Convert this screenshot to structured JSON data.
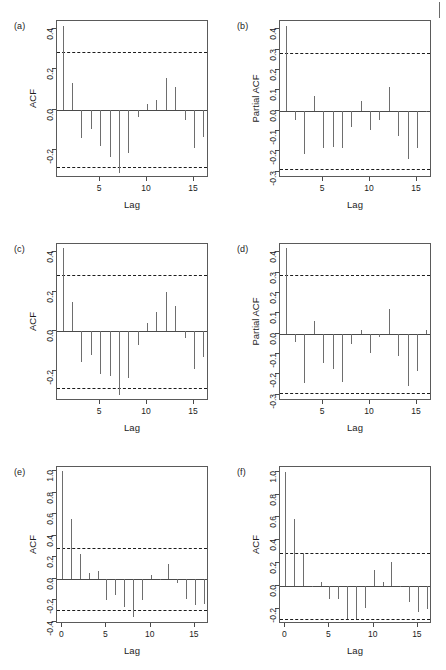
{
  "figure": {
    "width": 446,
    "height": 670,
    "background": "#ffffff",
    "bar_color": "#6e6e6e",
    "axis_color": "#4a4a4a",
    "band_color": "#1c1c1c",
    "corner_mark": "page-edge-tick"
  },
  "common": {
    "xlabel": "Lag",
    "acf_ylabel": "ACF",
    "pacf_ylabel": "Partial ACF"
  },
  "chart_data": [
    {
      "id": "a",
      "tag": "(a)",
      "type": "bar",
      "title": "",
      "xlabel": "Lag",
      "ylabel": "ACF",
      "xticks": [
        5,
        10,
        15
      ],
      "xticklabels": [
        "5",
        "10",
        "15"
      ],
      "yticks": [
        -0.2,
        0.0,
        0.2,
        0.4
      ],
      "yticklabels": [
        "-0.2",
        "0.0",
        "0.2",
        "0.4"
      ],
      "xlim": [
        0.4,
        16.6
      ],
      "ylim": [
        -0.34,
        0.44
      ],
      "conf_level": 0.285,
      "grid": false,
      "legend": "none",
      "x": [
        1,
        2,
        3,
        4,
        5,
        6,
        7,
        8,
        9,
        10,
        11,
        12,
        13,
        14,
        15,
        16
      ],
      "values": [
        0.415,
        0.131,
        -0.139,
        -0.098,
        -0.182,
        -0.237,
        -0.315,
        -0.216,
        -0.039,
        0.028,
        0.05,
        0.156,
        0.11,
        -0.05,
        -0.192,
        -0.135
      ]
    },
    {
      "id": "b",
      "tag": "(b)",
      "type": "bar",
      "title": "",
      "xlabel": "Lag",
      "ylabel": "Partial ACF",
      "xticks": [
        5,
        10,
        15
      ],
      "xticklabels": [
        "5",
        "10",
        "15"
      ],
      "yticks": [
        -0.3,
        -0.2,
        -0.1,
        0.0,
        0.1,
        0.2,
        0.3,
        0.4
      ],
      "yticklabels": [
        "-0.3",
        "-0.2",
        "-0.1",
        "0.0",
        "0.1",
        "0.2",
        "0.3",
        "0.4"
      ],
      "xlim": [
        0.4,
        16.6
      ],
      "ylim": [
        -0.33,
        0.44
      ],
      "conf_level": 0.285,
      "grid": false,
      "legend": "none",
      "x": [
        1,
        2,
        3,
        4,
        5,
        6,
        7,
        8,
        9,
        10,
        11,
        12,
        13,
        14,
        15,
        16
      ],
      "values": [
        0.415,
        -0.048,
        -0.211,
        0.073,
        -0.182,
        -0.178,
        -0.182,
        -0.081,
        0.05,
        -0.094,
        -0.045,
        0.117,
        -0.122,
        -0.237,
        -0.181,
        -0.005
      ]
    },
    {
      "id": "c",
      "tag": "(c)",
      "type": "bar",
      "title": "",
      "xlabel": "Lag",
      "ylabel": "ACF",
      "xticks": [
        5,
        10,
        15
      ],
      "xticklabels": [
        "5",
        "10",
        "15"
      ],
      "yticks": [
        -0.2,
        0.0,
        0.2,
        0.4
      ],
      "yticklabels": [
        "-0.2",
        "0.0",
        "0.2",
        "0.4"
      ],
      "xlim": [
        0.4,
        16.6
      ],
      "ylim": [
        -0.35,
        0.44
      ],
      "conf_level": 0.285,
      "grid": false,
      "legend": "none",
      "x": [
        1,
        2,
        3,
        4,
        5,
        6,
        7,
        8,
        9,
        10,
        11,
        12,
        13,
        14,
        15,
        16
      ],
      "values": [
        0.42,
        0.148,
        -0.155,
        -0.12,
        -0.212,
        -0.222,
        -0.322,
        -0.235,
        -0.066,
        0.044,
        0.096,
        0.196,
        0.127,
        -0.032,
        -0.19,
        -0.128
      ]
    },
    {
      "id": "d",
      "tag": "(d)",
      "type": "bar",
      "title": "",
      "xlabel": "Lag",
      "ylabel": "Partial ACF",
      "xticks": [
        5,
        10,
        15
      ],
      "xticklabels": [
        "5",
        "10",
        "15"
      ],
      "yticks": [
        -0.3,
        -0.2,
        -0.1,
        0.0,
        0.1,
        0.2,
        0.3,
        0.4
      ],
      "yticklabels": [
        "-0.3",
        "-0.2",
        "-0.1",
        "0.0",
        "0.1",
        "0.2",
        "0.3",
        "0.4"
      ],
      "xlim": [
        0.4,
        16.6
      ],
      "ylim": [
        -0.33,
        0.44
      ],
      "conf_level": 0.29,
      "grid": false,
      "legend": "none",
      "x": [
        1,
        2,
        3,
        4,
        5,
        6,
        7,
        8,
        9,
        10,
        11,
        12,
        13,
        14,
        15,
        16
      ],
      "values": [
        0.42,
        -0.04,
        -0.24,
        0.06,
        -0.142,
        -0.175,
        -0.236,
        -0.052,
        0.016,
        -0.094,
        -0.014,
        0.121,
        -0.109,
        -0.255,
        -0.181,
        0.018
      ]
    },
    {
      "id": "e",
      "tag": "(e)",
      "type": "bar",
      "title": "",
      "xlabel": "Lag",
      "ylabel": "ACF",
      "xticks": [
        0,
        5,
        10,
        15
      ],
      "xticklabels": [
        "0",
        "5",
        "10",
        "15"
      ],
      "yticks": [
        -0.4,
        -0.2,
        0.0,
        0.2,
        0.4,
        0.6,
        0.8,
        1.0
      ],
      "yticklabels": [
        "-0.4",
        "-0.2",
        "0.0",
        "0.2",
        "0.4",
        "0.6",
        "0.8",
        "1.0"
      ],
      "xlim": [
        -0.6,
        16.6
      ],
      "ylim": [
        -0.42,
        1.04
      ],
      "conf_level": 0.29,
      "grid": false,
      "legend": "none",
      "x": [
        0,
        1,
        2,
        3,
        4,
        5,
        6,
        7,
        8,
        9,
        10,
        11,
        12,
        13,
        14,
        15,
        16
      ],
      "values": [
        1.0,
        0.555,
        0.232,
        0.058,
        0.072,
        -0.193,
        -0.155,
        -0.26,
        -0.355,
        -0.2,
        0.032,
        -0.005,
        0.14,
        -0.04,
        -0.185,
        -0.245,
        -0.235
      ]
    },
    {
      "id": "f",
      "tag": "(f)",
      "type": "bar",
      "title": "",
      "xlabel": "Lag",
      "ylabel": "ACF",
      "xticks": [
        0,
        5,
        10,
        15
      ],
      "xticklabels": [
        "0",
        "5",
        "10",
        "15"
      ],
      "yticks": [
        -0.2,
        0.0,
        0.2,
        0.4,
        0.6,
        0.8,
        1.0
      ],
      "yticklabels": [
        "-0.2",
        "0.0",
        "0.2",
        "0.4",
        "0.6",
        "0.8",
        "1.0"
      ],
      "xlim": [
        -0.6,
        16.6
      ],
      "ylim": [
        -0.33,
        1.04
      ],
      "conf_level": 0.29,
      "grid": false,
      "legend": "none",
      "x": [
        0,
        1,
        2,
        3,
        4,
        5,
        6,
        7,
        8,
        9,
        10,
        11,
        12,
        13,
        14,
        15,
        16
      ],
      "values": [
        1.0,
        0.585,
        0.29,
        -0.01,
        0.04,
        -0.115,
        -0.108,
        -0.29,
        -0.29,
        -0.188,
        0.145,
        0.035,
        0.21,
        -0.005,
        -0.135,
        -0.225,
        -0.2
      ]
    }
  ]
}
